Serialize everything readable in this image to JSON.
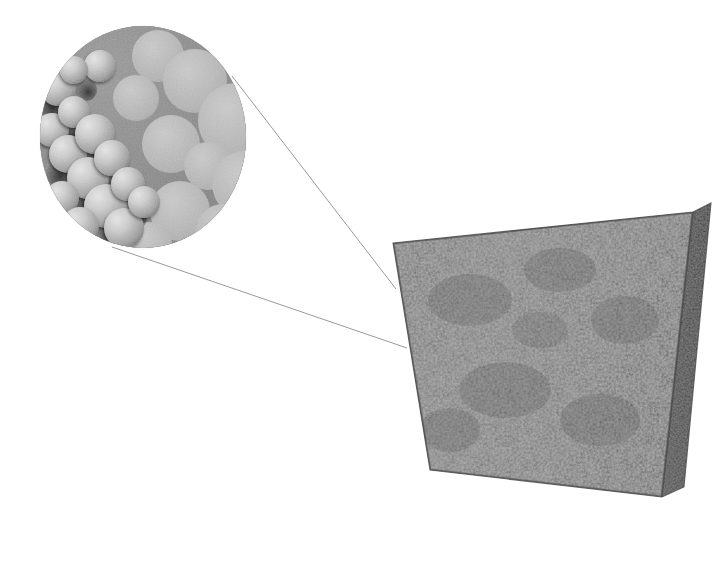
{
  "figure": {
    "caption": "",
    "background_color": "#ffffff",
    "width": 725,
    "height": 566
  },
  "specimen": {
    "name": "porous-foam-cube",
    "description": "Three-dimensional rendered cube of a porous foam material",
    "front_face_color": "#6e6e6e",
    "side_face_color": "#4a4a4a",
    "top_face_color": "#7a7a7a",
    "outline_color": "#3a3a3a",
    "front_face_points": "393,243 693,212 662,497 430,470",
    "side_face_points": "693,212 711,203 684,487 662,497",
    "geometry": {
      "top_left": "393,243",
      "top_right": "693,212",
      "bottom_right": "662,497",
      "bottom_left": "430,470",
      "depth_top_right": "711,203",
      "depth_bottom_right": "684,487"
    }
  },
  "callout": {
    "name": "magnified-microstructure",
    "description": "Circular magnified view of the porous microstructure",
    "shape": "circle",
    "center_x": 143,
    "center_y": 137,
    "radius_x": 103,
    "radius_y": 111,
    "matrix_color": "#8b8b8b",
    "pore_color": "#b4b4b4",
    "highlight_color": "#e2e2e2",
    "shadow_color": "#3b3b3b"
  },
  "leader_lines": {
    "color": "#9a9a9a",
    "width": 1,
    "lines": [
      {
        "name": "upper-leader-line",
        "x1": 232,
        "y1": 76,
        "x2": 396,
        "y2": 289
      },
      {
        "name": "lower-leader-line",
        "x1": 112,
        "y1": 247,
        "x2": 407,
        "y2": 348
      }
    ]
  },
  "microstructure": {
    "flat_pores": [
      {
        "cx": 118,
        "cy": 30,
        "r": 26
      },
      {
        "cx": 155,
        "cy": 55,
        "r": 32
      },
      {
        "cx": 196,
        "cy": 95,
        "r": 38
      },
      {
        "cx": 131,
        "cy": 118,
        "r": 29
      },
      {
        "cx": 168,
        "cy": 140,
        "r": 24
      },
      {
        "cx": 205,
        "cy": 158,
        "r": 33
      },
      {
        "cx": 140,
        "cy": 185,
        "r": 30
      },
      {
        "cx": 183,
        "cy": 205,
        "r": 27
      },
      {
        "cx": 96,
        "cy": 72,
        "r": 23
      },
      {
        "cx": 212,
        "cy": 42,
        "r": 20
      },
      {
        "cx": 110,
        "cy": 218,
        "r": 22
      },
      {
        "cx": 218,
        "cy": 200,
        "r": 18
      }
    ],
    "shaded_pores": [
      {
        "cx": 18,
        "cy": 62,
        "r": 18
      },
      {
        "cx": 12,
        "cy": 104,
        "r": 17
      },
      {
        "cx": 34,
        "cy": 86,
        "r": 16
      },
      {
        "cx": 28,
        "cy": 128,
        "r": 19
      },
      {
        "cx": 55,
        "cy": 108,
        "r": 20
      },
      {
        "cx": 48,
        "cy": 152,
        "r": 21
      },
      {
        "cx": 22,
        "cy": 172,
        "r": 17
      },
      {
        "cx": 72,
        "cy": 132,
        "r": 18
      },
      {
        "cx": 66,
        "cy": 180,
        "r": 22
      },
      {
        "cx": 40,
        "cy": 200,
        "r": 19
      },
      {
        "cx": 88,
        "cy": 158,
        "r": 17
      },
      {
        "cx": 84,
        "cy": 202,
        "r": 20
      },
      {
        "cx": 60,
        "cy": 40,
        "r": 16
      },
      {
        "cx": 34,
        "cy": 44,
        "r": 14
      },
      {
        "cx": 104,
        "cy": 176,
        "r": 16
      }
    ],
    "pore_shadows": [
      {
        "cx": 10,
        "cy": 80,
        "r": 13
      },
      {
        "cx": 30,
        "cy": 108,
        "r": 12
      },
      {
        "cx": 52,
        "cy": 132,
        "r": 13
      },
      {
        "cx": 44,
        "cy": 176,
        "r": 12
      },
      {
        "cx": 74,
        "cy": 158,
        "r": 11
      },
      {
        "cx": 18,
        "cy": 148,
        "r": 12
      },
      {
        "cx": 70,
        "cy": 206,
        "r": 12
      },
      {
        "cx": 96,
        "cy": 192,
        "r": 11
      },
      {
        "cx": 46,
        "cy": 64,
        "r": 11
      }
    ]
  },
  "accessibility": {
    "figure_label": "Rendered porous foam specimen with circular magnified inset of its microstructure"
  }
}
